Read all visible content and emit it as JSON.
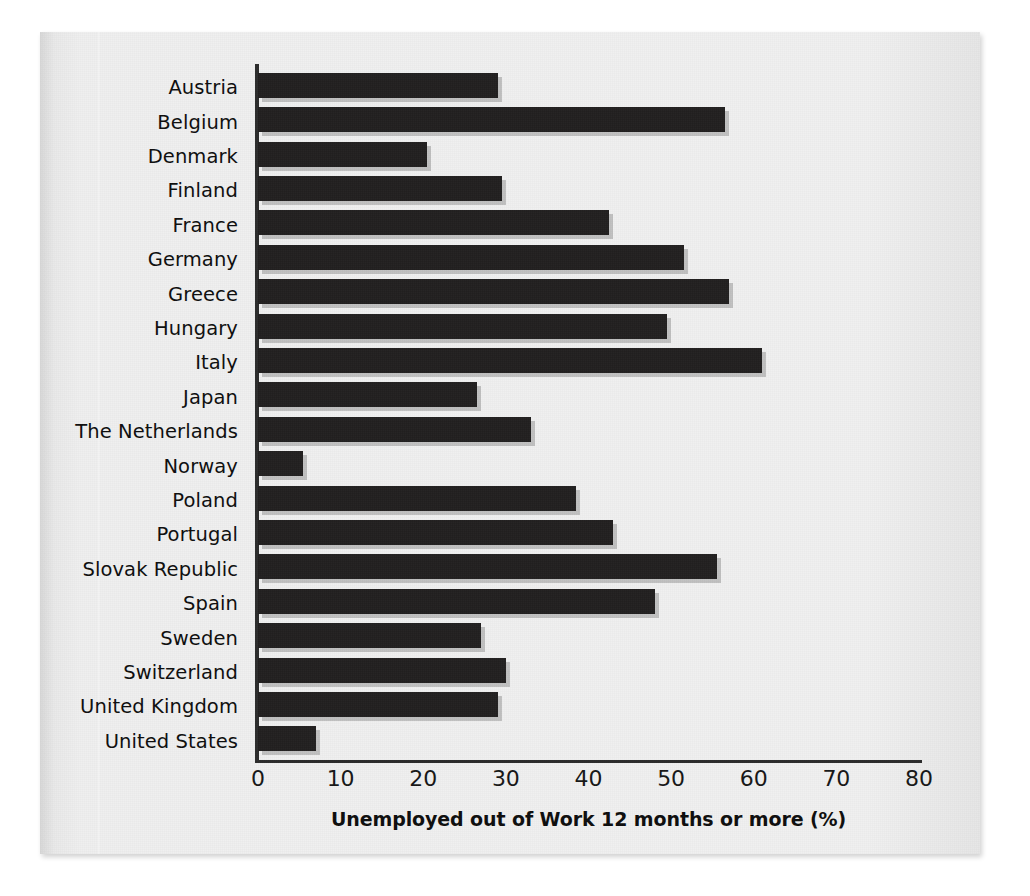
{
  "chart_data": {
    "type": "bar",
    "orientation": "horizontal",
    "title": "",
    "xlabel": "Unemployed out of Work 12 months or more (%)",
    "ylabel": "",
    "xlim": [
      0,
      80
    ],
    "xticks": [
      0,
      10,
      20,
      30,
      40,
      50,
      60,
      70,
      80
    ],
    "grid": false,
    "legend": null,
    "bar_color": "#211f1f",
    "categories": [
      "Austria",
      "Belgium",
      "Denmark",
      "Finland",
      "France",
      "Germany",
      "Greece",
      "Hungary",
      "Italy",
      "Japan",
      "The Netherlands",
      "Norway",
      "Poland",
      "Portugal",
      "Slovak Republic",
      "Spain",
      "Sweden",
      "Switzerland",
      "United Kingdom",
      "United States"
    ],
    "values": [
      29,
      56.5,
      20.5,
      29.5,
      42.5,
      51.5,
      57,
      49.5,
      61,
      26.5,
      33,
      5.5,
      38.5,
      43,
      55.5,
      48,
      27,
      30,
      29,
      7
    ]
  }
}
